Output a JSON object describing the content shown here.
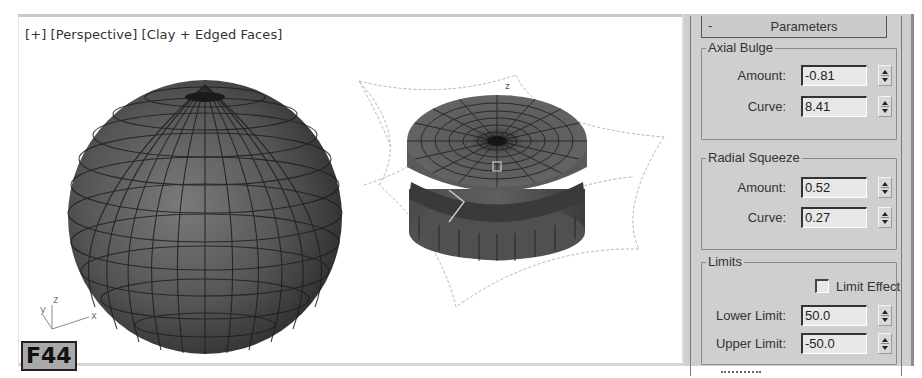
{
  "figure": {
    "cut_title": "... e 2 ...",
    "badge": "F44"
  },
  "viewport": {
    "label_plus": "[+]",
    "label_view": "[Perspective]",
    "label_shading": "[Clay + Edged Faces]",
    "label_full": "[ + ] [Perspective ] [Clay + Edged Faces ]",
    "axis_labels": {
      "x": "x",
      "y": "y",
      "z": "z"
    },
    "objects": [
      {
        "name": "sphere",
        "type": "Sphere"
      },
      {
        "name": "bulged-cylinder",
        "type": "Cylinder with Stretch/Squeeze gizmo"
      }
    ]
  },
  "panel": {
    "rollout": {
      "collapse_symbol": "-",
      "title": "Parameters"
    },
    "groups": [
      {
        "title": "Axial Bulge",
        "fields": [
          {
            "label": "Amount:",
            "value": "-0.81"
          },
          {
            "label": "Curve:",
            "value": "8.41"
          }
        ]
      },
      {
        "title": "Radial Squeeze",
        "fields": [
          {
            "label": "Amount:",
            "value": "0.52"
          },
          {
            "label": "Curve:",
            "value": "0.27"
          }
        ]
      },
      {
        "title": "Limits",
        "checkbox": {
          "label": "Limit Effect",
          "checked": false
        },
        "fields": [
          {
            "label": "Lower Limit:",
            "value": "50.0"
          },
          {
            "label": "Upper Limit:",
            "value": "-50.0"
          }
        ]
      }
    ]
  },
  "colors": {
    "panel_bg": "#cfcfcf",
    "field_bg": "#e8e8e8",
    "mesh_dark": "#3a3a3a",
    "mesh_mid": "#6a6a6a",
    "gizmo_line": "#b8b8b8"
  }
}
